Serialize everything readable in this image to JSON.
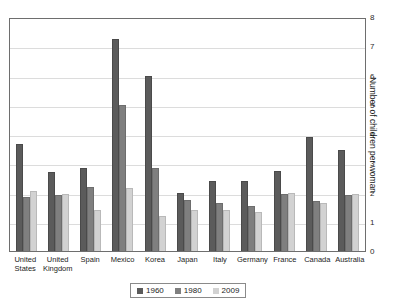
{
  "top_clipped_text": "",
  "chart_data": {
    "type": "bar",
    "title": "",
    "subtitle": "",
    "xlabel": "",
    "ylabel": "Number of children per woman",
    "ylim": [
      0,
      8
    ],
    "yticks": [
      0,
      1,
      2,
      3,
      4,
      5,
      6,
      7,
      8
    ],
    "ytick_labels": [
      "0",
      "1",
      "2",
      "3",
      "4",
      "5",
      "6",
      "7",
      "8"
    ],
    "grid": true,
    "y_axis_position": "right",
    "legend_position": "bottom-center",
    "categories": [
      "United States",
      "United Kingdom",
      "Spain",
      "Mexico",
      "Korea",
      "Japan",
      "Italy",
      "Germany",
      "France",
      "Canada",
      "Australia"
    ],
    "category_label_lines": [
      [
        "United",
        "States"
      ],
      [
        "United",
        "Kingdom"
      ],
      [
        "Spain"
      ],
      [
        "Mexico"
      ],
      [
        "Korea"
      ],
      [
        "Japan"
      ],
      [
        "Italy"
      ],
      [
        "Germany"
      ],
      [
        "France"
      ],
      [
        "Canada"
      ],
      [
        "Australia"
      ]
    ],
    "series": [
      {
        "name": "1960",
        "color": "#5b5b5b",
        "values": [
          3.65,
          2.7,
          2.85,
          7.25,
          6.0,
          2.0,
          2.4,
          2.4,
          2.75,
          3.9,
          3.45
        ]
      },
      {
        "name": "1980",
        "color": "#7f7f7f",
        "values": [
          1.85,
          1.9,
          2.2,
          5.0,
          2.85,
          1.75,
          1.65,
          1.55,
          1.95,
          1.7,
          1.9
        ]
      },
      {
        "name": "2009",
        "color": "#d2d2d2",
        "values": [
          2.05,
          1.95,
          1.4,
          2.15,
          1.2,
          1.4,
          1.4,
          1.35,
          2.0,
          1.65,
          1.95
        ]
      }
    ]
  },
  "legend": {
    "items": [
      {
        "label": "1960"
      },
      {
        "label": "1980"
      },
      {
        "label": "2009"
      }
    ]
  }
}
